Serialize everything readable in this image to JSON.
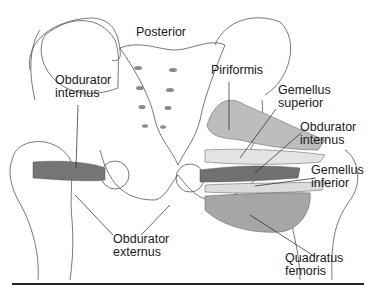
{
  "figure": {
    "orientation_label": "Posterior",
    "labels": {
      "obturator_internus_left": [
        "Obdurator",
        "internus"
      ],
      "piriformis": [
        "Piriformis"
      ],
      "gemellus_superior": [
        "Gemellus",
        "superior"
      ],
      "obturator_internus_right": [
        "Obdurator",
        "internus"
      ],
      "gemellus_inferior": [
        "Gemellus",
        "inferior"
      ],
      "obturator_externus": [
        "Obdurator",
        "externus"
      ],
      "quadratus_femoris": [
        "Quadratus",
        "femoris"
      ]
    }
  },
  "colors": {
    "outline": "#555555",
    "muscle_dark": "#6e6e6e",
    "muscle_mid": "#9a9a9a",
    "muscle_light": "#c8c8c8",
    "rule": "#222222"
  }
}
